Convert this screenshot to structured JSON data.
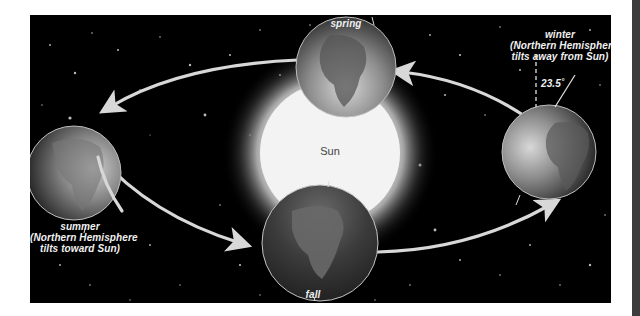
{
  "diagram": {
    "center_body": {
      "label": "Sun"
    },
    "positions": [
      {
        "id": "spring",
        "label": "spring"
      },
      {
        "id": "summer",
        "label": "summer",
        "note_line1": "(Northern Hemisphere",
        "note_line2": "tilts toward Sun)"
      },
      {
        "id": "fall",
        "label": "fall"
      },
      {
        "id": "winter",
        "label": "winter",
        "note_line1": "(Northern Hemisphere",
        "note_line2": "tilts away from Sun)"
      }
    ],
    "tilt_angle": "23.5˚",
    "colors": {
      "space": "#000000",
      "sun": "#f4f4f4",
      "orbit_arrow": "#d8d8d8",
      "label_text": "#f0f0f0",
      "page_background": "#ffffff",
      "side_strip": "#3c3c3c"
    }
  }
}
